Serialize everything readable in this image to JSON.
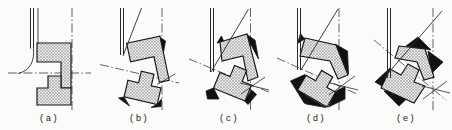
{
  "figure": {
    "palette": {
      "outline": "#161616",
      "interference_fill": "#111111",
      "hatch_line": "#979797",
      "hatch_bg": "#ebebeb",
      "centerline": "#3a3a3a",
      "tool_line": "#2a2a2a",
      "background": "#fbfbf9"
    },
    "panel_lefts": [
      5,
      95,
      185,
      272,
      362
    ],
    "label_pos": {
      "x": 44,
      "y": 121
    },
    "panels": [
      {
        "id": "a",
        "label": "(a)",
        "tool": {
          "x1": 25.5,
          "x2": 28.5,
          "y1": 8,
          "y2": 48.5
        },
        "tilt_line": [
          33,
          8,
          33,
          44
        ],
        "vdash_x": 67,
        "rdash": [
          3,
          73,
          86,
          73
        ],
        "solids": [],
        "arc": "M28.5,48.5 C29.5,60 26,70.5 13,73.5",
        "upper": [
          [
            32,
            43
          ],
          [
            66,
            43
          ],
          [
            66,
            88
          ],
          [
            56,
            88
          ],
          [
            56,
            62
          ],
          [
            32,
            62
          ]
        ],
        "lower": [
          [
            32,
            88
          ],
          [
            43,
            88
          ],
          [
            43,
            76
          ],
          [
            56,
            76
          ],
          [
            56,
            88
          ],
          [
            66,
            88
          ],
          [
            66,
            105
          ],
          [
            32,
            105
          ]
        ],
        "black": []
      },
      {
        "id": "b",
        "label": "(b)",
        "tool": {
          "x1": 25.5,
          "x2": 28.5,
          "y1": 8,
          "y2": 55
        },
        "tilt_line": [
          28,
          56,
          46.5,
          8
        ],
        "vdash_x": 67,
        "rdash": [
          5,
          64.5,
          84,
          83
        ],
        "solids": [
          [
            62,
            84.5,
            80,
            74
          ]
        ],
        "arc": null,
        "upper": [
          [
            31.6,
            43.3
          ],
          [
            64.9,
            36.2
          ],
          [
            74.2,
            80.2
          ],
          [
            64.4,
            82.3
          ],
          [
            59,
            56.8
          ],
          [
            35.6,
            61.8
          ]
        ],
        "lower": [
          [
            32.9,
            80.3
          ],
          [
            43.6,
            82.8
          ],
          [
            46.3,
            71.1
          ],
          [
            59,
            74.1
          ],
          [
            56.3,
            85.8
          ],
          [
            66,
            88
          ],
          [
            62.2,
            104.6
          ],
          [
            29.1,
            96.9
          ]
        ],
        "black": [
          [
            [
              63,
              36
            ],
            [
              70.5,
              41
            ],
            [
              68.5,
              52
            ]
          ],
          [
            [
              29,
              97
            ],
            [
              34.5,
              106
            ],
            [
              23.5,
              98
            ]
          ],
          [
            [
              62.5,
              104
            ],
            [
              66.5,
              99
            ],
            [
              66,
              106.5
            ],
            [
              56,
              107.5
            ]
          ]
        ]
      },
      {
        "id": "c",
        "label": "(c)",
        "tool": {
          "x1": 25.5,
          "x2": 28.5,
          "y1": 8,
          "y2": 72
        },
        "tilt_line": [
          26,
          72,
          63.5,
          9
        ],
        "vdash_x": 65.5,
        "rdash": [
          4,
          59,
          86,
          93
        ],
        "solids": [
          [
            56,
            94,
            80,
            77
          ],
          [
            55,
            83,
            84,
            90
          ]
        ],
        "arc": null,
        "upper": [
          [
            35,
            42
          ],
          [
            62,
            34
          ],
          [
            73,
            77
          ],
          [
            63,
            81
          ],
          [
            58,
            56
          ],
          [
            37,
            61
          ]
        ],
        "lower": [
          [
            34.9,
            72.5
          ],
          [
            45,
            76.6
          ],
          [
            49.5,
            65.5
          ],
          [
            61.6,
            70.4
          ],
          [
            57.1,
            81.5
          ],
          [
            66.4,
            85.2
          ],
          [
            60,
            101
          ],
          [
            28.5,
            88.3
          ]
        ],
        "black": [
          [
            [
              32,
              43
            ],
            [
              36.5,
              36
            ],
            [
              39,
              42
            ]
          ],
          [
            [
              61,
              34
            ],
            [
              70,
              40
            ],
            [
              73.5,
              59
            ],
            [
              65,
              43
            ]
          ],
          [
            [
              28.5,
              88
            ],
            [
              34,
              99
            ],
            [
              22.5,
              99
            ],
            [
              21,
              91
            ]
          ],
          [
            [
              59.5,
              101
            ],
            [
              66.5,
              90
            ],
            [
              71.5,
              94.5
            ],
            [
              63,
              104.5
            ]
          ]
        ]
      },
      {
        "id": "d",
        "label": "(d)",
        "tool": {
          "x1": 25.5,
          "x2": 28.5,
          "y1": 8,
          "y2": 70
        },
        "tilt_line": [
          29,
          70,
          66,
          9
        ],
        "vdash_x": 67,
        "rdash": [
          5,
          58,
          85,
          94
        ],
        "solids": [
          [
            57,
            95,
            83,
            76
          ],
          [
            58,
            83,
            86,
            90
          ]
        ],
        "arc": null,
        "upper": [
          [
            33,
            38
          ],
          [
            64,
            45
          ],
          [
            76,
            75
          ],
          [
            66,
            79
          ],
          [
            58,
            61
          ],
          [
            28,
            56
          ]
        ],
        "lower": [
          [
            34.1,
            75.3
          ],
          [
            43.6,
            80.8
          ],
          [
            49.6,
            70.4
          ],
          [
            60.8,
            76.9
          ],
          [
            54.8,
            87.3
          ],
          [
            63.5,
            92.3
          ],
          [
            55,
            107
          ],
          [
            25.6,
            90
          ]
        ],
        "black": [
          [
            [
              32.5,
              39
            ],
            [
              25.5,
              43.5
            ],
            [
              28.5,
              33.5
            ]
          ],
          [
            [
              63,
              44
            ],
            [
              75.5,
              51
            ],
            [
              76.5,
              74
            ]
          ],
          [
            [
              33,
              74.5
            ],
            [
              18.5,
              81
            ],
            [
              32.5,
              103.5
            ]
          ],
          [
            [
              25,
              90.5
            ],
            [
              54,
              107.5
            ],
            [
              34,
              104
            ]
          ],
          [
            [
              63.5,
              91.5
            ],
            [
              73,
              86.5
            ],
            [
              73,
              99
            ],
            [
              56.5,
              107
            ]
          ]
        ]
      },
      {
        "id": "e",
        "label": "(e)",
        "tool": {
          "x1": 25.5,
          "x2": 28.5,
          "y1": 8,
          "y2": 78
        },
        "tilt_line": [
          22,
          78,
          80,
          11
        ],
        "vdash_x": 71,
        "rdash": [
          12,
          40,
          84,
          100
        ],
        "solids": [
          [
            61,
            99,
            85,
            81
          ],
          [
            60,
            86,
            88,
            93
          ]
        ],
        "arc": null,
        "upper": [
          [
            37,
            46
          ],
          [
            63,
            49
          ],
          [
            72,
            77
          ],
          [
            62,
            80
          ],
          [
            55,
            62
          ],
          [
            33,
            58
          ]
        ],
        "lower": [
          [
            28,
            69
          ],
          [
            39,
            75
          ],
          [
            46,
            64
          ],
          [
            57,
            70
          ],
          [
            52,
            82
          ],
          [
            63,
            86
          ],
          [
            52,
            103
          ],
          [
            19,
            88
          ]
        ],
        "black": [
          [
            [
              56,
              37
            ],
            [
              69,
              50
            ],
            [
              44,
              46
            ]
          ],
          [
            [
              81,
              62
            ],
            [
              69,
              74
            ],
            [
              66,
              51
            ]
          ],
          [
            [
              37,
              106
            ],
            [
              22,
              91
            ],
            [
              53,
              91
            ]
          ],
          [
            [
              13,
              82
            ],
            [
              28,
              68
            ],
            [
              27,
              90
            ]
          ]
        ]
      }
    ]
  }
}
